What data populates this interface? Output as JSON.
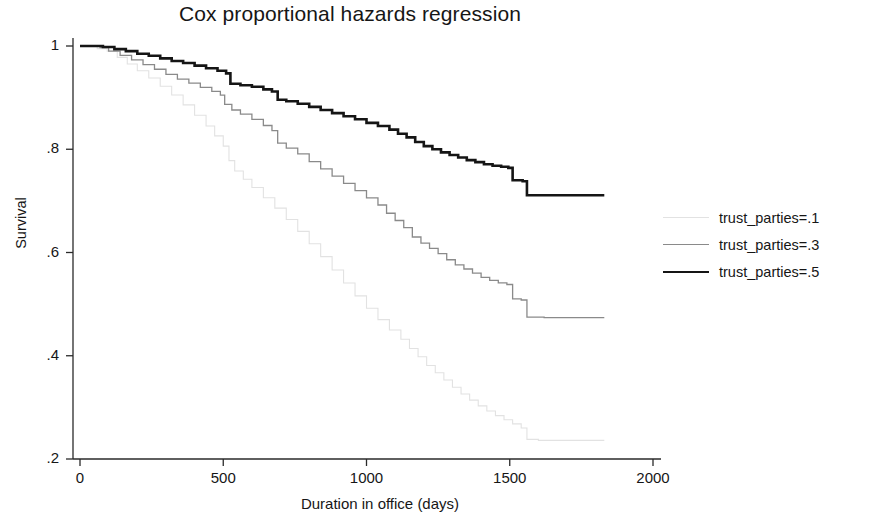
{
  "chart_data": {
    "type": "line",
    "title": "Cox proportional hazards regression",
    "xlabel": "Duration in office (days)",
    "ylabel": "Survival",
    "xlim": [
      0,
      2000
    ],
    "ylim": [
      0.2,
      1.0
    ],
    "xticks": [
      0,
      500,
      1000,
      1500,
      2000
    ],
    "xtick_labels": [
      "0",
      "500",
      "1000",
      "1500",
      "2000"
    ],
    "yticks": [
      0.2,
      0.4,
      0.6,
      0.8,
      1
    ],
    "ytick_labels": [
      ".2",
      ".4",
      ".6",
      ".8",
      "1"
    ],
    "grid": false,
    "legend_position": "right",
    "series": [
      {
        "name": "trust_parties=.1",
        "color": "#e2e2e2",
        "width": 1.1,
        "points": [
          [
            0,
            1.0
          ],
          [
            30,
            1.0
          ],
          [
            60,
            0.995
          ],
          [
            95,
            0.99
          ],
          [
            130,
            0.978
          ],
          [
            165,
            0.965
          ],
          [
            200,
            0.952
          ],
          [
            240,
            0.938
          ],
          [
            280,
            0.922
          ],
          [
            320,
            0.905
          ],
          [
            360,
            0.886
          ],
          [
            400,
            0.866
          ],
          [
            440,
            0.845
          ],
          [
            470,
            0.826
          ],
          [
            500,
            0.806
          ],
          [
            520,
            0.778
          ],
          [
            540,
            0.758
          ],
          [
            570,
            0.742
          ],
          [
            600,
            0.726
          ],
          [
            640,
            0.706
          ],
          [
            680,
            0.686
          ],
          [
            720,
            0.664
          ],
          [
            760,
            0.641
          ],
          [
            800,
            0.617
          ],
          [
            840,
            0.592
          ],
          [
            880,
            0.566
          ],
          [
            920,
            0.541
          ],
          [
            960,
            0.516
          ],
          [
            1000,
            0.492
          ],
          [
            1040,
            0.47
          ],
          [
            1080,
            0.45
          ],
          [
            1120,
            0.432
          ],
          [
            1150,
            0.414
          ],
          [
            1180,
            0.398
          ],
          [
            1210,
            0.381
          ],
          [
            1240,
            0.367
          ],
          [
            1270,
            0.353
          ],
          [
            1300,
            0.339
          ],
          [
            1330,
            0.326
          ],
          [
            1360,
            0.314
          ],
          [
            1390,
            0.303
          ],
          [
            1420,
            0.293
          ],
          [
            1450,
            0.284
          ],
          [
            1480,
            0.276
          ],
          [
            1510,
            0.268
          ],
          [
            1540,
            0.26
          ],
          [
            1560,
            0.238
          ],
          [
            1600,
            0.236
          ],
          [
            1700,
            0.236
          ],
          [
            1830,
            0.236
          ]
        ]
      },
      {
        "name": "trust_parties=.3",
        "color": "#8a8a8a",
        "width": 1.3,
        "points": [
          [
            0,
            1.0
          ],
          [
            40,
            1.0
          ],
          [
            70,
            0.997
          ],
          [
            100,
            0.99
          ],
          [
            140,
            0.982
          ],
          [
            180,
            0.973
          ],
          [
            220,
            0.964
          ],
          [
            260,
            0.955
          ],
          [
            300,
            0.945
          ],
          [
            340,
            0.936
          ],
          [
            380,
            0.928
          ],
          [
            420,
            0.92
          ],
          [
            460,
            0.912
          ],
          [
            490,
            0.905
          ],
          [
            505,
            0.887
          ],
          [
            530,
            0.876
          ],
          [
            560,
            0.868
          ],
          [
            600,
            0.858
          ],
          [
            640,
            0.846
          ],
          [
            670,
            0.836
          ],
          [
            690,
            0.812
          ],
          [
            720,
            0.802
          ],
          [
            760,
            0.791
          ],
          [
            800,
            0.776
          ],
          [
            840,
            0.762
          ],
          [
            880,
            0.748
          ],
          [
            920,
            0.734
          ],
          [
            960,
            0.72
          ],
          [
            1000,
            0.706
          ],
          [
            1040,
            0.692
          ],
          [
            1070,
            0.676
          ],
          [
            1100,
            0.662
          ],
          [
            1130,
            0.648
          ],
          [
            1160,
            0.63
          ],
          [
            1190,
            0.618
          ],
          [
            1220,
            0.608
          ],
          [
            1250,
            0.598
          ],
          [
            1280,
            0.586
          ],
          [
            1310,
            0.576
          ],
          [
            1340,
            0.568
          ],
          [
            1370,
            0.56
          ],
          [
            1400,
            0.552
          ],
          [
            1430,
            0.546
          ],
          [
            1460,
            0.541
          ],
          [
            1490,
            0.538
          ],
          [
            1510,
            0.51
          ],
          [
            1540,
            0.508
          ],
          [
            1560,
            0.475
          ],
          [
            1620,
            0.474
          ],
          [
            1720,
            0.474
          ],
          [
            1830,
            0.474
          ]
        ]
      },
      {
        "name": "trust_parties=.5",
        "color": "#151515",
        "width": 2.6,
        "points": [
          [
            0,
            1.0
          ],
          [
            50,
            1.0
          ],
          [
            80,
            0.998
          ],
          [
            120,
            0.994
          ],
          [
            160,
            0.99
          ],
          [
            200,
            0.985
          ],
          [
            240,
            0.981
          ],
          [
            280,
            0.976
          ],
          [
            320,
            0.971
          ],
          [
            360,
            0.967
          ],
          [
            400,
            0.962
          ],
          [
            440,
            0.957
          ],
          [
            480,
            0.952
          ],
          [
            510,
            0.947
          ],
          [
            525,
            0.927
          ],
          [
            560,
            0.924
          ],
          [
            600,
            0.921
          ],
          [
            640,
            0.916
          ],
          [
            670,
            0.912
          ],
          [
            690,
            0.896
          ],
          [
            720,
            0.893
          ],
          [
            760,
            0.888
          ],
          [
            800,
            0.882
          ],
          [
            840,
            0.876
          ],
          [
            880,
            0.87
          ],
          [
            920,
            0.864
          ],
          [
            960,
            0.858
          ],
          [
            1000,
            0.851
          ],
          [
            1040,
            0.845
          ],
          [
            1080,
            0.838
          ],
          [
            1110,
            0.83
          ],
          [
            1140,
            0.823
          ],
          [
            1170,
            0.814
          ],
          [
            1200,
            0.806
          ],
          [
            1230,
            0.8
          ],
          [
            1260,
            0.794
          ],
          [
            1290,
            0.789
          ],
          [
            1320,
            0.784
          ],
          [
            1350,
            0.779
          ],
          [
            1380,
            0.775
          ],
          [
            1410,
            0.771
          ],
          [
            1440,
            0.768
          ],
          [
            1470,
            0.766
          ],
          [
            1495,
            0.764
          ],
          [
            1510,
            0.74
          ],
          [
            1545,
            0.738
          ],
          [
            1560,
            0.711
          ],
          [
            1620,
            0.711
          ],
          [
            1720,
            0.711
          ],
          [
            1830,
            0.711
          ]
        ]
      }
    ]
  },
  "legend": {
    "items": [
      {
        "label": "trust_parties=.1",
        "color": "#e2e2e2",
        "width": 1.2
      },
      {
        "label": "trust_parties=.3",
        "color": "#8a8a8a",
        "width": 1.4
      },
      {
        "label": "trust_parties=.5",
        "color": "#151515",
        "width": 2.6
      }
    ]
  },
  "axes": {
    "color": "#2a2a2a"
  }
}
